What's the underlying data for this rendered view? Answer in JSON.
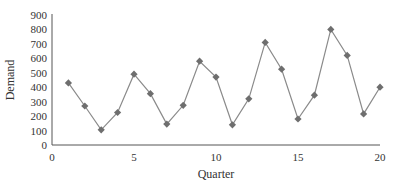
{
  "chart_data": {
    "type": "line",
    "title": "",
    "xlabel": "Quarter",
    "ylabel": "Demand",
    "xlim": [
      0,
      20
    ],
    "ylim": [
      0,
      900
    ],
    "x_ticks": [
      0,
      5,
      10,
      15,
      20
    ],
    "y_ticks": [
      0,
      100,
      200,
      300,
      400,
      500,
      600,
      700,
      800,
      900
    ],
    "grid": false,
    "legend": null,
    "x": [
      1,
      2,
      3,
      4,
      5,
      6,
      7,
      8,
      9,
      10,
      11,
      12,
      13,
      14,
      15,
      16,
      17,
      18,
      19,
      20
    ],
    "series": [
      {
        "name": "Demand",
        "marker": "diamond",
        "values": [
          430,
          270,
          105,
          225,
          490,
          355,
          145,
          275,
          580,
          470,
          140,
          320,
          710,
          525,
          180,
          345,
          800,
          620,
          215,
          400
        ]
      }
    ]
  },
  "colors": {
    "line": "#8a8a8a",
    "marker": "#6e6e6e",
    "axis": "#555555",
    "text": "#333333"
  }
}
